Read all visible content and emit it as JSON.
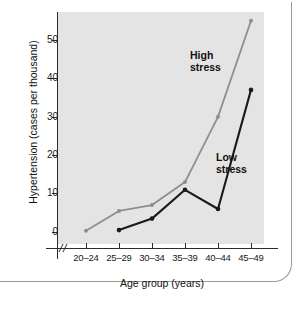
{
  "chart_data": {
    "type": "line",
    "title": "",
    "xlabel": "Age group (years)",
    "ylabel": "Hypertension (cases per thousand)",
    "categories": [
      "20–24",
      "25–29",
      "30–34",
      "35–39",
      "40–44",
      "45–49"
    ],
    "ylim": [
      0,
      57
    ],
    "yticks": [
      0,
      10,
      20,
      30,
      40,
      50
    ],
    "ytick_labels": [
      "0",
      "10",
      "20",
      "30",
      "40",
      "50"
    ],
    "grid": false,
    "legend_position": "inline-annotations",
    "x_axis_break": true,
    "series": [
      {
        "name": "High stress",
        "color": "#8e8e8e",
        "values": [
          0.3,
          5.5,
          7,
          13,
          30,
          55
        ]
      },
      {
        "name": "Low stress",
        "color": "#1a1a1a",
        "values": [
          null,
          0.5,
          3.5,
          11,
          6,
          37
        ]
      }
    ],
    "annotations": [
      {
        "name": "high-stress-label",
        "line1": "High",
        "line2": "stress"
      },
      {
        "name": "low-stress-label",
        "line1": "Low",
        "line2": "stress"
      }
    ]
  },
  "axis": {
    "y_label": "Hypertension (cases per thousand)",
    "x_label": "Age group (years)",
    "y_ticks": [
      "0",
      "10",
      "20",
      "30",
      "40",
      "50"
    ],
    "x_ticks": [
      "20–24",
      "25–29",
      "30–34",
      "35–39",
      "40–44",
      "45–49"
    ]
  },
  "labels": {
    "high_stress_line1": "High",
    "high_stress_line2": "stress",
    "low_stress_line1": "Low",
    "low_stress_line2": "stress"
  },
  "colors": {
    "high_stress": "#8e8e8e",
    "low_stress": "#1a1a1a",
    "plot_background": "#e4e4e4",
    "axis": "#2b2b2b",
    "frame": "#9a9a9a"
  }
}
